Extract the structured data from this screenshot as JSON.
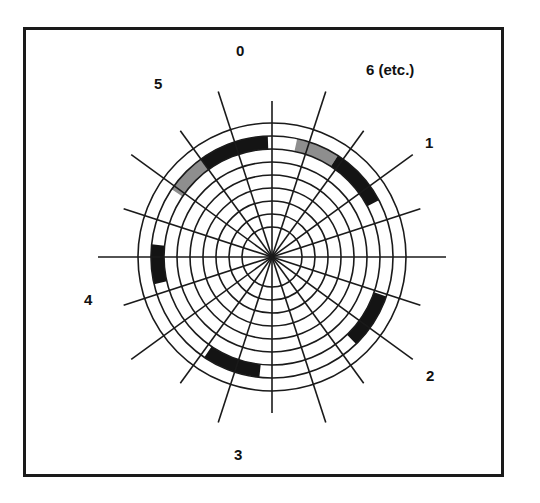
{
  "figure": {
    "title": "",
    "background_color": "#ffffff",
    "frame": {
      "border_color": "#1a1a1a",
      "border_width_px": 3,
      "x": 23,
      "y": 27,
      "width": 481,
      "height": 450
    }
  },
  "chart_data": {
    "type": "polar",
    "title": "",
    "xlabel": "",
    "ylabel": "",
    "grid": true,
    "legend_position": "none",
    "center": {
      "x": 272,
      "y": 257
    },
    "radial_grid": {
      "ring_count": 9,
      "inner_radius_px": 30,
      "outer_radius_px": 134,
      "ring_radii_px": [
        30,
        43,
        56,
        69,
        82,
        95,
        108,
        121,
        134
      ],
      "line_color": "#1a1a1a",
      "line_width_px": 1.6
    },
    "angular_grid": {
      "spoke_count": 20,
      "sector_count": 20,
      "spoke_angle_step_deg": 18,
      "spoke_overshoot_px": 40,
      "line_color": "#1a1a1a",
      "line_width_px": 1.6
    },
    "sector_labels": [
      {
        "label": "0",
        "angle_deg": 0,
        "x": 236,
        "y": 43
      },
      {
        "label": "6 (etc.)",
        "angle_deg": 324,
        "x": 366,
        "y": 62
      },
      {
        "label": "5",
        "angle_deg": 36,
        "x": 154,
        "y": 76
      },
      {
        "label": "1",
        "angle_deg": 288,
        "x": 425,
        "y": 135
      },
      {
        "label": "4",
        "angle_deg": 108,
        "x": 84,
        "y": 292
      },
      {
        "label": "2",
        "angle_deg": 252,
        "x": 426,
        "y": 368
      },
      {
        "label": "3",
        "angle_deg": 180,
        "x": 234,
        "y": 447
      }
    ],
    "colors": {
      "dark_segment": "#141414",
      "light_segment": "#8e8e8e",
      "grid_line": "#1a1a1a",
      "frame": "#1a1a1a",
      "background": "#ffffff",
      "label_text": "#111111"
    },
    "segments": [
      {
        "name": "upper-left-gray",
        "fill": "#8e8e8e",
        "start_angle_deg": 304,
        "end_angle_deg": 324,
        "inner_radius_px": 108,
        "outer_radius_px": 121
      },
      {
        "name": "top-left-black",
        "fill": "#141414",
        "start_angle_deg": 324,
        "end_angle_deg": 358,
        "inner_radius_px": 108,
        "outer_radius_px": 121
      },
      {
        "name": "upper-right-gray",
        "fill": "#8e8e8e",
        "start_angle_deg": 12,
        "end_angle_deg": 33,
        "inner_radius_px": 108,
        "outer_radius_px": 121
      },
      {
        "name": "right-upper-black",
        "fill": "#141414",
        "start_angle_deg": 33,
        "end_angle_deg": 62,
        "inner_radius_px": 108,
        "outer_radius_px": 121
      },
      {
        "name": "right-lower-black",
        "fill": "#141414",
        "start_angle_deg": 109,
        "end_angle_deg": 136,
        "inner_radius_px": 108,
        "outer_radius_px": 121
      },
      {
        "name": "bottom-black",
        "fill": "#141414",
        "start_angle_deg": 186,
        "end_angle_deg": 214,
        "inner_radius_px": 108,
        "outer_radius_px": 121
      },
      {
        "name": "left-black",
        "fill": "#141414",
        "start_angle_deg": 257,
        "end_angle_deg": 276,
        "inner_radius_px": 108,
        "outer_radius_px": 121
      }
    ]
  }
}
